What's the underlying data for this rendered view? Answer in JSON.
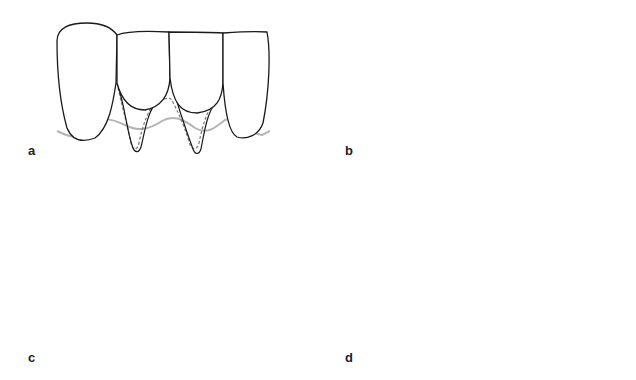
{
  "figure": {
    "panels": [
      {
        "id": "a",
        "label": "a",
        "label_pos": [
          28,
          143
        ],
        "description": "Recession defects on two lower incisors with dashed outline of planned incision"
      },
      {
        "id": "b",
        "label": "b",
        "label_pos": [
          345,
          143
        ],
        "description": "Scalpel blade de-epithelializing/preparing recipient bed with rectangular flap outline"
      },
      {
        "id": "c",
        "label": "c",
        "label_pos": [
          28,
          350
        ],
        "description": "Graft held by tissue forceps being slid under the flap (arrow indicates direction)"
      },
      {
        "id": "d",
        "label": "d",
        "label_pos": [
          345,
          350
        ],
        "description": "Graft positioned and secured with sutures"
      }
    ],
    "colors": {
      "tooth_outline": "#1a1a1a",
      "gingiva_line": "#b5b5b5",
      "dashed_outline": "#7a7a7a",
      "blade": "#a8a8a8",
      "graft_c": "#9d9d9d",
      "graft_d_fill": "#d9d9d9",
      "graft_d_border": "#aaaaaa",
      "flap_outline": "#bcbcbc",
      "arrow": "#8a8a8a",
      "suture": "#9a9a9a"
    }
  }
}
